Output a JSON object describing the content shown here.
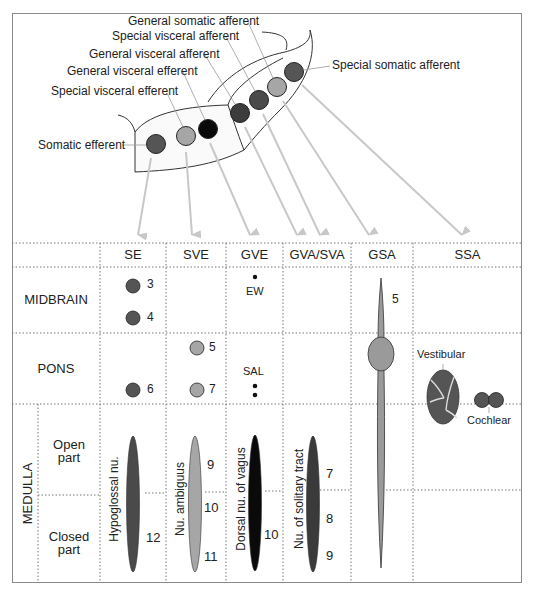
{
  "top_diagram": {
    "labels": {
      "somatic_efferent": "Somatic efferent",
      "special_visceral_efferent": "Special visceral efferent",
      "general_visceral_efferent": "General visceral efferent",
      "general_visceral_afferent": "General visceral afferent",
      "special_visceral_afferent": "Special visceral afferent",
      "general_somatic_afferent": "General somatic afferent",
      "special_somatic_afferent": "Special somatic afferent"
    },
    "colors": {
      "dark_gray": "#555555",
      "light_gray": "#a6a6a6",
      "black": "#0a0a0a",
      "darker_gray": "#3c3c3c",
      "arrow": "#c8c8c8"
    }
  },
  "table": {
    "columns": [
      "SE",
      "SVE",
      "GVE",
      "GVA/SVA",
      "GSA",
      "SSA"
    ],
    "rows": {
      "midbrain": "MIDBRAIN",
      "pons": "PONS",
      "medulla": "MEDULLA",
      "medulla_open": [
        "Open",
        "part"
      ],
      "medulla_closed": [
        "Closed",
        "part"
      ]
    },
    "midbrain": {
      "se_nuclei": [
        "3",
        "4"
      ],
      "gve_label": "EW",
      "gsa_number": "5"
    },
    "pons": {
      "se_nuclei": [
        "6"
      ],
      "sve_nuclei": [
        "5",
        "7"
      ],
      "gve_label": "SAL",
      "ssa_vestibular": "Vestibular",
      "ssa_cochlear": "Cochlear"
    },
    "medulla": {
      "se_nucleus_name": "Hypoglossal nu.",
      "se_numbers": [
        "12"
      ],
      "sve_nucleus_name": "Nu. ambiguus",
      "sve_numbers": [
        "9",
        "10",
        "11"
      ],
      "gve_nucleus_name": "Dorsal nu. of vagus",
      "gve_numbers": [
        "10"
      ],
      "gva_nucleus_name": "Nu. of solitary tract",
      "gva_numbers": [
        "7",
        "8",
        "9"
      ]
    }
  }
}
